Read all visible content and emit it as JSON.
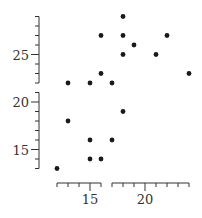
{
  "chart_data": {
    "type": "scatter",
    "title": "",
    "xlabel": "",
    "ylabel": "",
    "style": "range-frame with broken axes, no grid, no legend",
    "xlim": [
      12,
      24
    ],
    "ylim": [
      13,
      29
    ],
    "x_axis_segments": [
      [
        12,
        16
      ],
      [
        17,
        24
      ]
    ],
    "y_axis_segments": [
      [
        13,
        21
      ],
      [
        22,
        29
      ]
    ],
    "x_ticks": [
      15,
      20
    ],
    "x_tick_labels": [
      "15",
      "20"
    ],
    "y_ticks": [
      15,
      20,
      25
    ],
    "y_tick_labels": [
      "15",
      "20",
      "25"
    ],
    "x_minor_step": 1,
    "y_minor_step": 1,
    "grid": false,
    "legend": null,
    "points": [
      {
        "x": 12,
        "y": 13
      },
      {
        "x": 13,
        "y": 22
      },
      {
        "x": 13,
        "y": 18
      },
      {
        "x": 15,
        "y": 22
      },
      {
        "x": 15,
        "y": 16
      },
      {
        "x": 15,
        "y": 14
      },
      {
        "x": 16,
        "y": 27
      },
      {
        "x": 16,
        "y": 23
      },
      {
        "x": 16,
        "y": 14
      },
      {
        "x": 17,
        "y": 22
      },
      {
        "x": 17,
        "y": 16
      },
      {
        "x": 18,
        "y": 29
      },
      {
        "x": 18,
        "y": 27
      },
      {
        "x": 18,
        "y": 25
      },
      {
        "x": 18,
        "y": 19
      },
      {
        "x": 19,
        "y": 26
      },
      {
        "x": 21,
        "y": 25
      },
      {
        "x": 22,
        "y": 27
      },
      {
        "x": 24,
        "y": 23
      }
    ],
    "colors": {
      "point": "#1a1a1a",
      "axis": "#333333"
    }
  }
}
